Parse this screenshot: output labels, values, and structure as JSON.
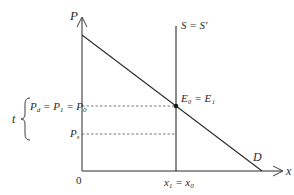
{
  "diagram": {
    "type": "supply-demand",
    "axes": {
      "y_label": "P",
      "x_label": "x",
      "origin_label": "0"
    },
    "curves": {
      "supply_label": "S = S′",
      "demand_label": "D"
    },
    "equilibrium": {
      "label": "E₀ = E₁"
    },
    "price_levels": {
      "upper_label": "P_d = P₁ = P₀",
      "upper_parts": [
        "P",
        "d",
        " = P",
        "1",
        " = P",
        "0"
      ],
      "lower_label": "P_s",
      "lower_parts": [
        "P",
        "s"
      ]
    },
    "quantity": {
      "label": "x₁ = x₀",
      "parts": [
        "x",
        "1",
        " = x",
        "0"
      ]
    },
    "tax_brace_label": "t",
    "colors": {
      "line": "#2a2a2a",
      "dashed": "#555555",
      "background": "#ffffff"
    }
  }
}
